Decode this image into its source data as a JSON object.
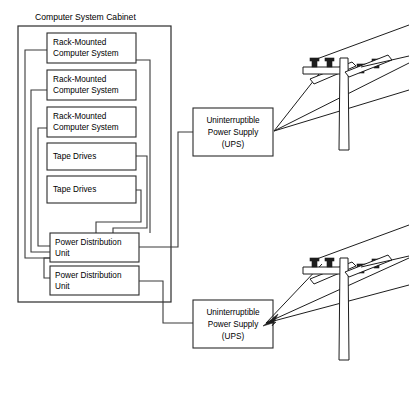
{
  "diagram": {
    "title": "Computer System Cabinet",
    "cabinet": {
      "label": "Computer System Cabinet",
      "components": [
        {
          "name": "rack-1",
          "line1": "Rack-Mounted",
          "line2": "Computer System"
        },
        {
          "name": "rack-2",
          "line1": "Rack-Mounted",
          "line2": "Computer System"
        },
        {
          "name": "rack-3",
          "line1": "Rack-Mounted",
          "line2": "Computer System"
        },
        {
          "name": "tape-1",
          "line1": "Tape Drives",
          "line2": ""
        },
        {
          "name": "tape-2",
          "line1": "Tape Drives",
          "line2": ""
        },
        {
          "name": "pdu-1",
          "line1": "Power Distribution",
          "line2": "Unit"
        },
        {
          "name": "pdu-2",
          "line1": "Power Distribution",
          "line2": "Unit"
        }
      ]
    },
    "ups_units": [
      {
        "name": "ups-top",
        "line1": "Uninterruptible",
        "line2": "Power Supply",
        "line3": "(UPS)"
      },
      {
        "name": "ups-bottom",
        "line1": "Uninterruptible",
        "line2": "Power Supply",
        "line3": "(UPS)"
      }
    ],
    "utility_poles": [
      {
        "name": "utility-pole-top",
        "insulator_count": 4,
        "crossarm_count": 2
      },
      {
        "name": "utility-pole-bottom",
        "insulator_count": 4,
        "crossarm_count": 2
      }
    ],
    "colors": {
      "background": "#ffffff",
      "stroke": "#2b2b2b",
      "wire": "#3a3a3a",
      "ink": "#000000"
    }
  }
}
